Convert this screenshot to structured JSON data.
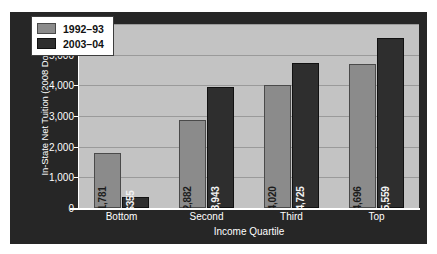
{
  "chart_data": {
    "type": "bar",
    "title": "",
    "xlabel": "Income Quartile",
    "ylabel": "In-State Net Tuition (2008 Dollars)",
    "categories": [
      "Bottom",
      "Second",
      "Third",
      "Top"
    ],
    "series": [
      {
        "name": "1992–93",
        "color": "#8b8b8b",
        "values": [
          1781,
          2882,
          4020,
          4696
        ],
        "labels": [
          "$1,781",
          "$2,882",
          "$4,020",
          "$4,696"
        ]
      },
      {
        "name": "2003–04",
        "color": "#2e2e2e",
        "values": [
          355,
          3943,
          4725,
          5559
        ],
        "labels": [
          "$355",
          "$3,943",
          "$4,725",
          "$5,559"
        ]
      }
    ],
    "ylim": [
      0,
      6000
    ],
    "ytick_values": [
      0,
      1000,
      2000,
      3000,
      4000,
      5000,
      6000
    ],
    "ytick_labels": [
      "0",
      "1,000",
      "2,000",
      "3,000",
      "4,000",
      "5,000",
      "6,000"
    ],
    "grid": true,
    "legend_position": "top-left",
    "plot_background_color": "#c3c3c3",
    "figure_background_color": "#262626",
    "gridline_color": "#9a9a9a",
    "axis_color": "#ffffff",
    "tick_label_color": "#ffffff"
  }
}
